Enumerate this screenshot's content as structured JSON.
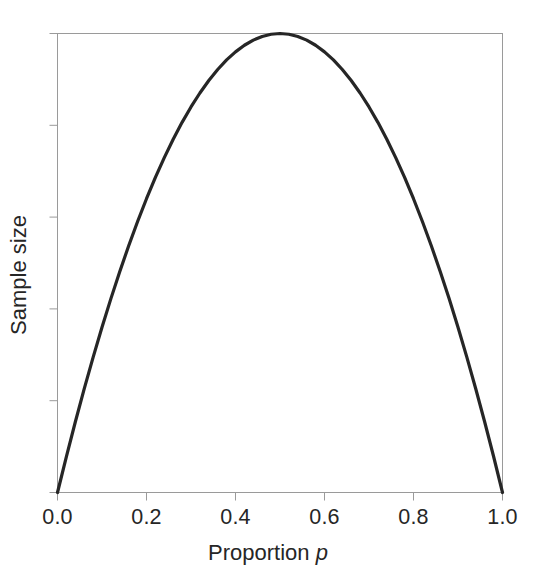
{
  "chart_data": {
    "type": "line",
    "title": "",
    "subtitle": "",
    "xlabel_prefix": "Proportion",
    "xlabel_symbol": "p",
    "ylabel": "Sample size",
    "xlim": [
      0.0,
      1.0
    ],
    "ylim": [
      0.0,
      1.0
    ],
    "grid": false,
    "legend": null,
    "legend_position": "none",
    "annotations": [],
    "x_tick_labels": [
      "0.0",
      "0.2",
      "0.4",
      "0.6",
      "0.8",
      "1.0"
    ],
    "x_tick_values": [
      0.0,
      0.2,
      0.4,
      0.6,
      0.8,
      1.0
    ],
    "y_tick_labels": [
      "",
      "",
      "",
      "",
      "",
      ""
    ],
    "y_tick_values": [
      0.0,
      0.2,
      0.4,
      0.6,
      0.8,
      1.0
    ],
    "series": [
      {
        "name": "Sample size",
        "color": "#262626",
        "x": [
          0.0,
          0.02,
          0.04,
          0.06,
          0.08,
          0.1,
          0.12,
          0.14,
          0.16,
          0.18,
          0.2,
          0.22,
          0.24,
          0.26,
          0.28,
          0.3,
          0.32,
          0.34,
          0.36,
          0.38,
          0.4,
          0.42,
          0.44,
          0.46,
          0.48,
          0.5,
          0.52,
          0.54,
          0.56,
          0.58,
          0.6,
          0.62,
          0.64,
          0.66,
          0.68,
          0.7,
          0.72,
          0.74,
          0.76,
          0.78,
          0.8,
          0.82,
          0.84,
          0.86,
          0.88,
          0.9,
          0.92,
          0.94,
          0.96,
          0.98,
          1.0
        ],
        "y": [
          0.0,
          0.0784,
          0.1536,
          0.2256,
          0.2944,
          0.36,
          0.4224,
          0.4816,
          0.5376,
          0.5904,
          0.64,
          0.6864,
          0.7296,
          0.7696,
          0.8064,
          0.84,
          0.8704,
          0.8976,
          0.9216,
          0.9424,
          0.96,
          0.9744,
          0.9856,
          0.9936,
          0.9984,
          1.0,
          0.9984,
          0.9936,
          0.9856,
          0.9744,
          0.96,
          0.9424,
          0.9216,
          0.8976,
          0.8704,
          0.84,
          0.8064,
          0.7696,
          0.7296,
          0.6864,
          0.64,
          0.5904,
          0.5376,
          0.4816,
          0.4224,
          0.36,
          0.2944,
          0.2256,
          0.1536,
          0.0784,
          0.0
        ]
      }
    ]
  },
  "style": {
    "curve_color": "#262626",
    "frame_color": "#9a9a9a",
    "tick_color": "#9a9a9a",
    "text_color": "#262626",
    "background": "#ffffff"
  }
}
